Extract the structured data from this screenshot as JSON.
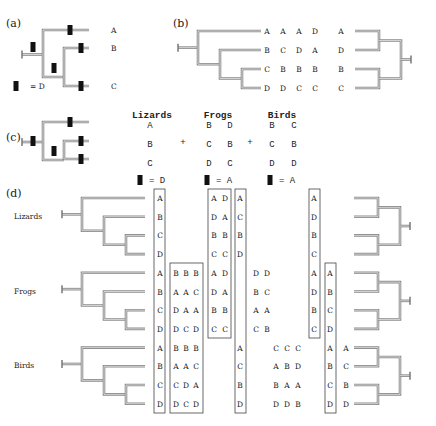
{
  "panels": {
    "a": {
      "label": "(a)",
      "leaves": [
        "A",
        "B",
        "C"
      ],
      "legend": {
        "marker": "black-bar",
        "eq": "=",
        "value": "D"
      }
    },
    "b": {
      "label": "(b)",
      "columns": [
        [
          "A",
          "B",
          "C",
          "D"
        ],
        [
          "A",
          "C",
          "B",
          "D"
        ],
        [
          "A",
          "D",
          "B",
          "C"
        ],
        [
          "D",
          "A",
          "B",
          "C"
        ]
      ],
      "result_column": [
        "A",
        "D",
        "B",
        "C"
      ]
    },
    "c": {
      "label": "(c)",
      "groups": [
        {
          "name": "Lizards",
          "rows": [
            [
              "A"
            ],
            [
              "B"
            ],
            [
              "C"
            ]
          ],
          "legend": {
            "eq": "=",
            "value": "D"
          }
        },
        {
          "name": "Frogs",
          "rows": [
            [
              "B",
              "D"
            ],
            [
              "C",
              "B"
            ],
            [
              "D",
              "C"
            ]
          ],
          "legend": {
            "eq": "=",
            "value": "A"
          }
        },
        {
          "name": "Birds",
          "rows": [
            [
              "B",
              "C"
            ],
            [
              "C",
              "B"
            ],
            [
              "D",
              "D"
            ]
          ],
          "legend": {
            "eq": "=",
            "value": "A"
          }
        }
      ],
      "plus": "+"
    },
    "d": {
      "label": "(d)",
      "taxa": [
        "Lizards",
        "Frogs",
        "Birds"
      ],
      "col1": [
        "A",
        "B",
        "C",
        "D",
        "A",
        "B",
        "C",
        "D",
        "A",
        "B",
        "C",
        "D"
      ],
      "box_bbb_frogs": [
        [
          "B",
          "B",
          "B"
        ],
        [
          "A",
          "A",
          "C"
        ],
        [
          "D",
          "A",
          "A"
        ],
        [
          "D",
          "C",
          "D"
        ]
      ],
      "box_bbb_birds": [
        [
          "B",
          "B",
          "B"
        ],
        [
          "A",
          "A",
          "C"
        ],
        [
          "C",
          "D",
          "A"
        ],
        [
          "D",
          "C",
          "D"
        ]
      ],
      "box_ad": [
        [
          "A",
          "D"
        ],
        [
          "D",
          "A"
        ],
        [
          "B",
          "B"
        ],
        [
          "C",
          "C"
        ],
        [
          "A",
          "D"
        ],
        [
          "D",
          "A"
        ],
        [
          "B",
          "B"
        ],
        [
          "C",
          "C"
        ]
      ],
      "col_acbd_liz": [
        "A",
        "C",
        "B",
        "D"
      ],
      "col_acbd_birds": [
        "A",
        "C",
        "B",
        "D"
      ],
      "loose_dd": [
        [
          "D",
          "D"
        ],
        [
          "B",
          "C"
        ],
        [
          "A",
          "A"
        ],
        [
          "C",
          "B"
        ]
      ],
      "loose_ccc": [
        [
          "C",
          "C",
          "C"
        ],
        [
          "A",
          "B",
          "D"
        ],
        [
          "B",
          "A",
          "A"
        ],
        [
          "D",
          "D",
          "B"
        ]
      ],
      "box_adbc": [
        "A",
        "D",
        "B",
        "C",
        "A",
        "D",
        "B",
        "C"
      ],
      "box_abcd": [
        "A",
        "B",
        "C",
        "D",
        "A",
        "B",
        "C",
        "D"
      ],
      "col_acbd_right": [
        "A",
        "C",
        "B",
        "D"
      ]
    }
  }
}
